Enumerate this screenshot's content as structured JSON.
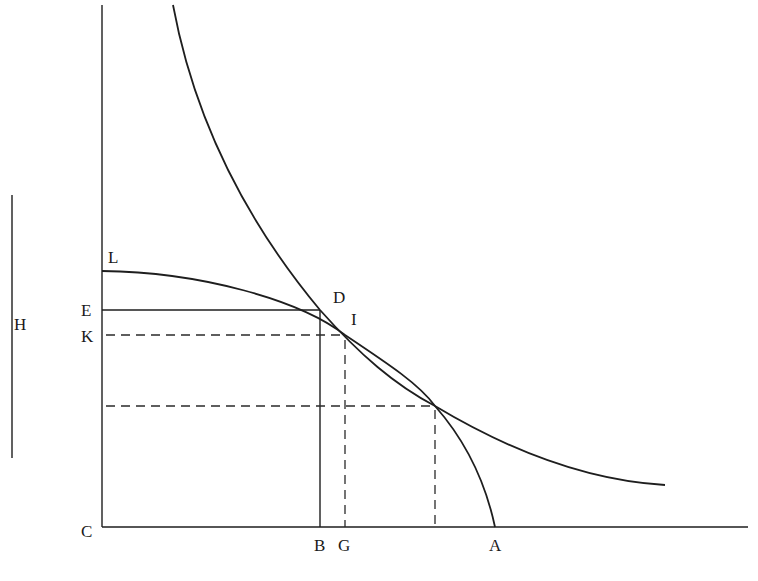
{
  "diagram": {
    "type": "geometric-construction",
    "colors": {
      "ink": "#1e1e1e",
      "background": "#ffffff"
    },
    "labels": {
      "L": "L",
      "E": "E",
      "K": "K",
      "C": "C",
      "B": "B",
      "G": "G",
      "A": "A",
      "D": "D",
      "I": "I",
      "H": "H"
    },
    "points": {
      "C": [
        102,
        527
      ],
      "L": [
        102,
        271
      ],
      "E": [
        102,
        310
      ],
      "K": [
        102,
        335
      ],
      "B": [
        320,
        527
      ],
      "G": [
        345,
        527
      ],
      "A": [
        495,
        527
      ],
      "D": [
        320,
        310
      ],
      "I": [
        345,
        335
      ],
      "intersection": [
        435,
        406
      ]
    },
    "segments": {
      "H_segment": {
        "x": 12,
        "y1": 195,
        "y2": 458
      }
    }
  }
}
